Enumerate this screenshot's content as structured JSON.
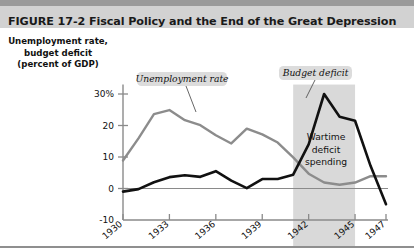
{
  "header": {
    "figure_word": "FIGURE",
    "figure_number": "17-2",
    "title": "Fiscal Policy and the End of the Great Depression",
    "full_title": "FIGURE  17-2  Fiscal Policy and the End of the Great Depression",
    "band_color": "#d2d2d2",
    "strip_color": "#9a9a9a"
  },
  "axis_title": {
    "line1": "Unemployment rate,",
    "line2": "budget deficit",
    "line3": "(percent of GDP)"
  },
  "callouts": {
    "unemployment": "Unemployment rate",
    "budget_deficit": "Budget deficit",
    "wartime_line1": "Wartime",
    "wartime_line2": "deficit",
    "wartime_line3": "spending"
  },
  "chart_data": {
    "type": "line",
    "title": "Fiscal Policy and the End of the Great Depression",
    "xlabel": "",
    "ylabel": "Unemployment rate, budget deficit (percent of GDP)",
    "ylim": [
      -10,
      33
    ],
    "xlim": [
      1930,
      1947
    ],
    "ytick_labels": [
      "30%",
      "20",
      "10",
      "0",
      "-10"
    ],
    "ytick_values": [
      30,
      20,
      10,
      0,
      -10
    ],
    "xtick_labels": [
      "1930",
      "1933",
      "1936",
      "1939",
      "1942",
      "1945",
      "1947"
    ],
    "xtick_values": [
      1930,
      1933,
      1936,
      1939,
      1942,
      1945,
      1947
    ],
    "grid": false,
    "zero_line": true,
    "legend_position": "inline-callouts",
    "x": [
      1930,
      1931,
      1932,
      1933,
      1934,
      1935,
      1936,
      1937,
      1938,
      1939,
      1940,
      1941,
      1942,
      1943,
      1944,
      1945,
      1946,
      1947
    ],
    "series": [
      {
        "name": "Unemployment rate",
        "color": "#8c8c8c",
        "values": [
          8.9,
          15.9,
          23.6,
          24.9,
          21.7,
          20.1,
          16.9,
          14.3,
          19.0,
          17.2,
          14.6,
          9.9,
          4.7,
          1.9,
          1.2,
          1.9,
          3.9,
          3.9
        ]
      },
      {
        "name": "Budget deficit",
        "color": "#111111",
        "values": [
          -1.0,
          -0.2,
          2.0,
          3.6,
          4.2,
          3.7,
          5.5,
          2.5,
          0.1,
          3.0,
          3.0,
          4.4,
          14.0,
          30.0,
          22.8,
          21.5,
          7.2,
          -5.0
        ]
      }
    ],
    "shaded_region": {
      "label": "Wartime deficit spending",
      "x_start": 1941,
      "x_end": 1945,
      "color": "#d9d9d9"
    }
  }
}
